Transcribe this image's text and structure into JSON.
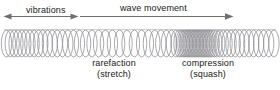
{
  "diagram": {
    "background_color": "#ffffff",
    "line_color": "#8d8d93",
    "arrow_color": "#6e6e73",
    "text_color": "#181818",
    "width": 280,
    "height": 90
  },
  "annotations": {
    "vibrations": {
      "label": "vibrations",
      "arrow_type": "double-headed",
      "arrow_direction": "left-right",
      "x_start": 4,
      "x_end": 78,
      "y": 16
    },
    "wave_movement": {
      "label": "wave movement",
      "arrow_type": "single-headed",
      "arrow_direction": "right",
      "x_start": 80,
      "x_end": 234,
      "y": 16
    }
  },
  "region_labels": {
    "rarefaction": {
      "name": "rarefaction",
      "subtitle": "(stretch)",
      "center_x": 114,
      "top_y": 58
    },
    "compression": {
      "name": "compression",
      "subtitle": "(squash)",
      "center_x": 208,
      "top_y": 58
    }
  },
  "chart_data": {
    "type": "line",
    "xlabel": "",
    "ylabel": "",
    "baseline_y": 30,
    "coil_top": 30,
    "coil_bottom": 57,
    "coil_half_width": 5.2,
    "coil_centers_x": [
      6.5,
      10.3,
      14.1,
      17.9,
      21.8,
      25.8,
      29.9,
      34.1,
      38.4,
      42.8,
      47.4,
      52.2,
      57.2,
      62.4,
      67.8,
      73.5,
      79.4,
      85.6,
      92.0,
      98.6,
      105.4,
      112.4,
      119.6,
      127.0,
      134.4,
      141.6,
      148.4,
      154.8,
      160.8,
      166.4,
      171.4,
      175.9,
      179.0,
      181.2,
      183.0,
      184.6,
      186.1,
      187.5,
      188.9,
      190.3,
      191.7,
      193.1,
      194.5,
      195.9,
      197.3,
      198.7,
      200.1,
      201.5,
      202.9,
      204.3,
      205.7,
      207.1,
      208.6,
      210.2,
      212.0,
      214.2,
      216.8,
      219.8,
      223.2,
      227.0,
      231.0,
      235.2,
      239.6,
      244.2,
      248.9,
      253.7,
      258.6,
      263.6,
      268.7,
      273.9
    ],
    "spacing_note": "Small gaps = compression (dense coils), large gaps = rarefaction (stretched coils)"
  }
}
